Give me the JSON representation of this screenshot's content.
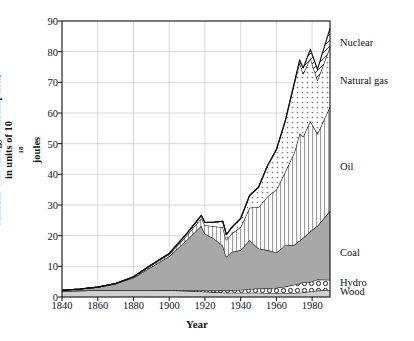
{
  "chart_data": {
    "type": "area",
    "stacked": true,
    "title": "",
    "xlabel": "Year",
    "ylabel": "Annual U.S. energy consumption, in units of 10^18 joules",
    "ylabel_parts": {
      "pre": "Annual U.S. energy consumption,",
      "mid": "in units of 10",
      "sup": "18",
      "post": " joules"
    },
    "xlim": [
      1840,
      1990
    ],
    "ylim": [
      0,
      90
    ],
    "xticks": [
      1840,
      1860,
      1880,
      1900,
      1920,
      1940,
      1960,
      1980
    ],
    "yticks": [
      0,
      10,
      20,
      30,
      40,
      50,
      60,
      70,
      80,
      90
    ],
    "grid": true,
    "legend_position": "right-inline",
    "x": [
      1840,
      1850,
      1860,
      1870,
      1880,
      1890,
      1900,
      1910,
      1918,
      1920,
      1925,
      1930,
      1932,
      1935,
      1940,
      1945,
      1950,
      1955,
      1960,
      1965,
      1970,
      1973,
      1975,
      1979,
      1983,
      1990
    ],
    "series": [
      {
        "name": "Wood",
        "pattern": "light-gray-solid",
        "values": [
          2.0,
          2.1,
          2.2,
          2.3,
          2.3,
          2.3,
          2.2,
          2.0,
          1.8,
          1.7,
          1.6,
          1.5,
          1.4,
          1.4,
          1.4,
          1.4,
          1.4,
          1.3,
          1.3,
          1.3,
          1.3,
          1.4,
          1.5,
          1.8,
          2.1,
          2.3
        ]
      },
      {
        "name": "Hydro",
        "pattern": "circles",
        "values": [
          0.0,
          0.0,
          0.0,
          0.0,
          0.0,
          0.0,
          0.1,
          0.2,
          0.4,
          0.4,
          0.5,
          0.7,
          0.7,
          0.8,
          0.9,
          1.2,
          1.4,
          1.5,
          1.7,
          2.1,
          2.7,
          3.0,
          3.3,
          3.1,
          3.6,
          3.3
        ]
      },
      {
        "name": "Coal",
        "pattern": "solid-gray",
        "values": [
          0.2,
          0.5,
          1.0,
          2.0,
          4.0,
          7.5,
          11.0,
          16.5,
          21.0,
          18.5,
          17.0,
          14.5,
          11.0,
          12.5,
          13.0,
          16.0,
          13.0,
          12.5,
          11.5,
          13.5,
          13.0,
          14.0,
          14.5,
          16.5,
          17.5,
          22.5
        ]
      },
      {
        "name": "Oil",
        "pattern": "vertical-lines",
        "values": [
          0.0,
          0.0,
          0.0,
          0.1,
          0.2,
          0.5,
          0.6,
          1.5,
          2.5,
          2.8,
          4.0,
          6.0,
          5.5,
          6.0,
          7.5,
          10.5,
          13.5,
          17.5,
          20.5,
          24.0,
          30.0,
          35.0,
          33.0,
          36.0,
          30.0,
          34.0
        ]
      },
      {
        "name": "Natural gas",
        "pattern": "dots",
        "values": [
          0.0,
          0.0,
          0.0,
          0.0,
          0.1,
          0.2,
          0.3,
          0.6,
          0.9,
          0.9,
          1.3,
          2.0,
          1.7,
          2.0,
          2.8,
          4.0,
          6.5,
          10.0,
          13.0,
          16.5,
          22.5,
          23.0,
          20.5,
          20.5,
          17.5,
          19.5
        ]
      },
      {
        "name": "Nuclear",
        "pattern": "diagonal-hatch",
        "values": [
          0.0,
          0.0,
          0.0,
          0.0,
          0.0,
          0.0,
          0.0,
          0.0,
          0.0,
          0.0,
          0.0,
          0.0,
          0.0,
          0.0,
          0.0,
          0.0,
          0.0,
          0.0,
          0.1,
          0.2,
          0.3,
          0.9,
          1.9,
          2.8,
          3.5,
          6.0
        ]
      }
    ],
    "legend_labels": [
      {
        "name": "Nuclear",
        "value": 82.5
      },
      {
        "name": "Natural gas",
        "value": 70.0
      },
      {
        "name": "Oil",
        "value": 42.0
      },
      {
        "name": "Coal",
        "value": 14.0
      },
      {
        "name": "Hydro",
        "value": 4.3
      },
      {
        "name": "Wood",
        "value": 1.2
      }
    ]
  },
  "axis": {
    "y_label_line1": "Annual U.S. energy consumption,",
    "y_label_line2_pre": "in units of 10",
    "y_label_line2_sup": "18",
    "y_label_line2_post": " joules",
    "x_label": "Year"
  }
}
